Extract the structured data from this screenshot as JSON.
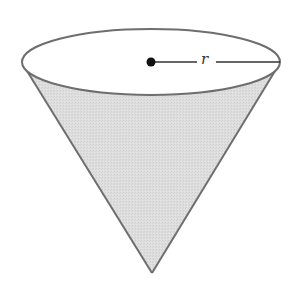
{
  "diagram": {
    "shape": "cone",
    "orientation": "apex-down",
    "colors": {
      "stroke": "#6e6e6e",
      "cone_fill": "#dcdcdc",
      "top_fill": "#ffffff",
      "radius_line": "#333333",
      "center_dot": "#111111"
    },
    "geometry": {
      "ellipse": {
        "cx": 151,
        "cy": 62,
        "rx": 129,
        "ry": 33
      },
      "apex": {
        "x": 152,
        "y": 273
      },
      "left_tangent": {
        "x": 28,
        "y": 72
      },
      "right_tangent": {
        "x": 274,
        "y": 72
      },
      "center": {
        "x": 151,
        "y": 62
      },
      "radius_end": {
        "x": 280,
        "y": 62
      }
    },
    "labels": {
      "radius": "r"
    }
  }
}
